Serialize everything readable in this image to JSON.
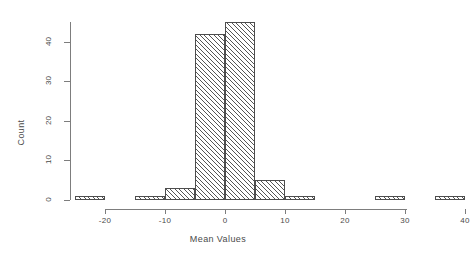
{
  "chart_data": {
    "type": "bar",
    "title": "",
    "subtitle": "",
    "xlabel": "Mean Values",
    "ylabel": "Count",
    "grid": false,
    "legend": false,
    "bin_width": 5,
    "xlim": [
      -25,
      40
    ],
    "ylim": [
      0,
      45
    ],
    "xticks": [
      -20,
      -10,
      0,
      10,
      20,
      30,
      40
    ],
    "xtick_labels": [
      "-20",
      "-10",
      "0",
      "10",
      "20",
      "30",
      "40"
    ],
    "yticks": [
      0,
      10,
      20,
      30,
      40
    ],
    "ytick_labels": [
      "0",
      "10",
      "20",
      "30",
      "40"
    ],
    "categories": [
      "-25 to -20",
      "-20 to -15",
      "-15 to -10",
      "-10 to -5",
      "-5 to 0",
      "0 to 5",
      "5 to 10",
      "10 to 15",
      "15 to 20",
      "20 to 25",
      "25 to 30",
      "30 to 35",
      "35 to 40"
    ],
    "bin_starts": [
      -25,
      -20,
      -15,
      -10,
      -5,
      0,
      5,
      10,
      15,
      20,
      25,
      30,
      35
    ],
    "bin_ends": [
      -20,
      -15,
      -10,
      -5,
      0,
      5,
      10,
      15,
      20,
      25,
      30,
      35,
      40
    ],
    "values": [
      1,
      0,
      1,
      3,
      42,
      45,
      5,
      1,
      0,
      0,
      1,
      0,
      1
    ]
  }
}
